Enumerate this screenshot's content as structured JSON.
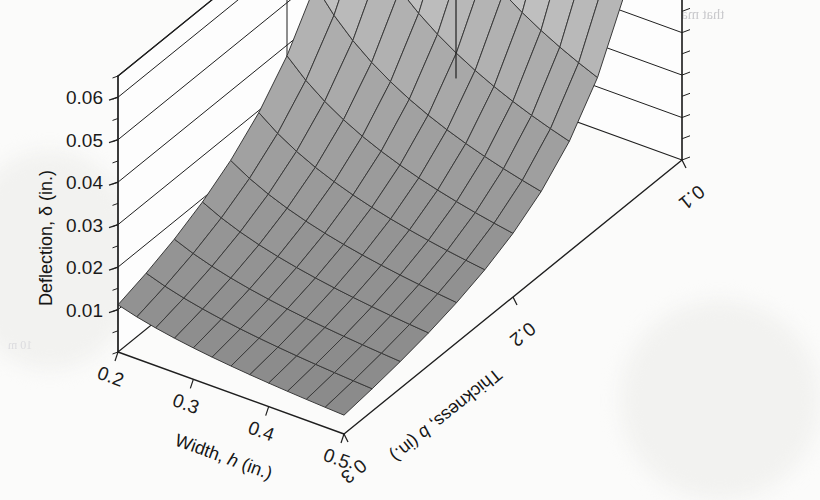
{
  "figure": {
    "background_color": "#fbfbfa",
    "surface_fill_light": "#c9c9c9",
    "surface_fill_dark": "#8a8a8a",
    "mesh_line_color": "#3a3a3a",
    "axis_line_color": "#1f1f1f"
  },
  "axes": {
    "z": {
      "title": "Deflection, δ (in.)",
      "ticks": [
        "0.01",
        "0.02",
        "0.03",
        "0.04",
        "0.05",
        "0.06"
      ],
      "values": [
        0.01,
        0.02,
        0.03,
        0.04,
        0.05,
        0.06
      ],
      "min": 0,
      "max": 0.065
    },
    "x": {
      "title_main": "Width, ",
      "title_var": "h",
      "title_unit": " (in.)",
      "title": "Width, h (in.)",
      "ticks": [
        "0.2",
        "0.3",
        "0.4",
        "0.5"
      ],
      "values": [
        0.2,
        0.3,
        0.4,
        0.5
      ],
      "min": 0.2,
      "max": 0.5
    },
    "y": {
      "title_main": "Thickness, ",
      "title_var": "b",
      "title_unit": " (in.)",
      "title": "Thickness, b (in.)",
      "ticks": [
        "0.3",
        "0.2",
        "0.1"
      ],
      "values": [
        0.3,
        0.2,
        0.1
      ],
      "min": 0.1,
      "max": 0.3
    }
  },
  "chart_data": {
    "type": "surface3d",
    "title": "",
    "xlabel": "Width, h (in.)",
    "ylabel": "Thickness, b (in.)",
    "zlabel": "Deflection, δ (in.)",
    "xlim": [
      0.2,
      0.5
    ],
    "ylim": [
      0.1,
      0.3
    ],
    "zlim": [
      0,
      0.065
    ],
    "grid": true,
    "legend": false,
    "mesh_divisions": 12,
    "x": [
      0.2,
      0.225,
      0.25,
      0.275,
      0.3,
      0.325,
      0.35,
      0.375,
      0.4,
      0.425,
      0.45,
      0.475,
      0.5
    ],
    "y": [
      0.1,
      0.11667,
      0.13333,
      0.15,
      0.16667,
      0.18333,
      0.2,
      0.21667,
      0.23333,
      0.25,
      0.26667,
      0.28333,
      0.3
    ],
    "z_formula_constant": 6e-05,
    "z_note": "delta = K / (h * b^3), K = 6e-5",
    "corner_values": {
      "h0.2_b0.1": 0.06,
      "h0.2_b0.3": 0.0222,
      "h0.5_b0.1": 0.024,
      "h0.5_b0.3": 0.0044
    },
    "peak": {
      "h": 0.2,
      "b": 0.1,
      "delta": 0.06
    },
    "minimum": {
      "h": 0.5,
      "b": 0.3,
      "delta": 0.0044
    }
  },
  "bleed_through_text": {
    "line1": "that makes the pole deflection zero at the point of wire attachment.",
    "line2": "mine the tension in the guy wire",
    "line3": "and Given Data",
    "line4": "10 m"
  }
}
